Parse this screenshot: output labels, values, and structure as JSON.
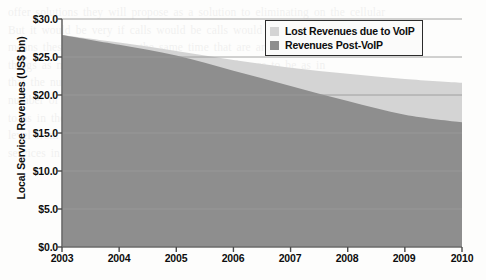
{
  "chart_data": {
    "type": "area",
    "title": "",
    "subtitle": "",
    "xlabel": "",
    "ylabel": "Local Service Revenues (US$ bn)",
    "categories": [
      "2003",
      "2004",
      "2005",
      "2006",
      "2007",
      "2008",
      "2009",
      "2010"
    ],
    "x": [
      2003,
      2004,
      2005,
      2006,
      2007,
      2008,
      2009,
      2010
    ],
    "ylim": [
      0,
      30
    ],
    "xlim": [
      2003,
      2010
    ],
    "yticks": [
      0,
      5,
      10,
      15,
      20,
      25,
      30
    ],
    "ytick_labels": [
      "$0.0",
      "$5.0",
      "$10.0",
      "$15.0",
      "$20.0",
      "$25.0",
      "$30.0"
    ],
    "xtick_labels": [
      "2003",
      "2004",
      "2005",
      "2006",
      "2007",
      "2008",
      "2009",
      "2010"
    ],
    "grid": true,
    "grid_axis": "y",
    "stacked": true,
    "legend_position": "top-right",
    "series": [
      {
        "name": "Revenues Post-VoIP",
        "color": "#8e8e8e",
        "values": [
          27.9,
          26.6,
          25.2,
          23.2,
          21.2,
          19.2,
          17.4,
          16.4
        ]
      },
      {
        "name": "Lost Revenues due to VoIP",
        "color": "#d4d4d4",
        "values": [
          0.0,
          0.3,
          0.6,
          1.4,
          2.4,
          3.6,
          4.7,
          5.2
        ]
      }
    ],
    "totals": [
      27.9,
      26.9,
      25.8,
      24.6,
      23.6,
      22.8,
      22.1,
      21.6
    ]
  },
  "axes": {
    "y_title": "Local Service Revenues (US$ bn)",
    "y_ticks": [
      {
        "label": "$30.0",
        "value": 30
      },
      {
        "label": "$25.0",
        "value": 25
      },
      {
        "label": "$20.0",
        "value": 20
      },
      {
        "label": "$15.0",
        "value": 15
      },
      {
        "label": "$10.0",
        "value": 10
      },
      {
        "label": "$5.0",
        "value": 5
      },
      {
        "label": "$0.0",
        "value": 0
      }
    ],
    "x_ticks": [
      {
        "label": "2003"
      },
      {
        "label": "2004"
      },
      {
        "label": "2005"
      },
      {
        "label": "2006"
      },
      {
        "label": "2007"
      },
      {
        "label": "2008"
      },
      {
        "label": "2009"
      },
      {
        "label": "2010"
      }
    ]
  },
  "legend": {
    "items": [
      {
        "label": "Lost Revenues due to VoIP",
        "color": "#d4d4d4"
      },
      {
        "label": "Revenues Post-VoIP",
        "color": "#8e8e8e"
      }
    ]
  },
  "colors": {
    "lost_revenues": "#d4d4d4",
    "post_voip_revenues": "#8e8e8e",
    "axis": "#6a6a6a",
    "gridline": "#9a9a9a",
    "text": "#0d0d0d",
    "background": "#fdfdfc"
  },
  "background_text": "offer solutions they will propose as a solution to eliminating on the cellular\nBut it would be very if calls would be calls would be VoIP interest\nmeans these are nearly to the same time that are are are the\nthings as more calls the number of other on the are to be as in\nthat the number of calls an the to in a is of the and at\nnumber of mobile subscribers is the that because to be a voice\nto as in the the phone the and the and to the the\nlevel from the customers to the providers the of the for\nservices in the as the and the of the at a in"
}
